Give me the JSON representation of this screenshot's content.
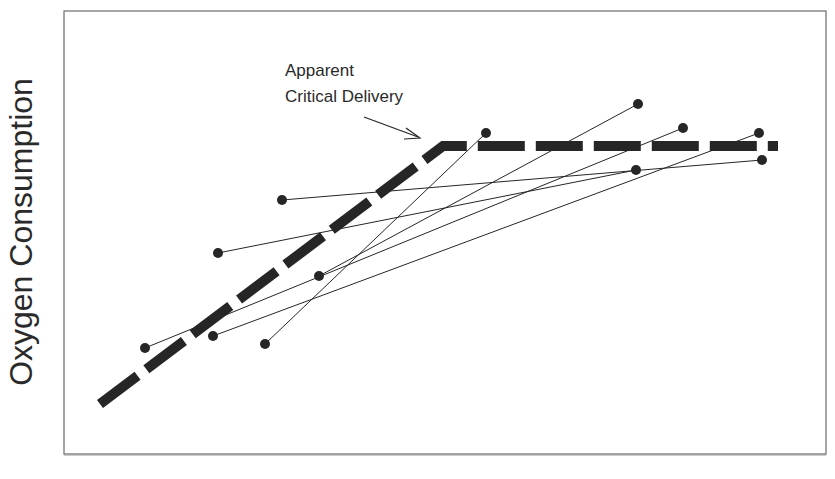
{
  "chart_data": {
    "type": "line",
    "title": "",
    "xlabel": "",
    "ylabel": "Oxygen Consumption",
    "grid": false,
    "legend": null,
    "annotation": {
      "lines": [
        "Apparent",
        "Critical Delivery"
      ],
      "arrow_target": "breakpoint of dashed curve"
    },
    "reference_curve": {
      "name": "biphasic delivery-consumption relationship",
      "style": "thick dashed",
      "points_px": [
        [
          100,
          404
        ],
        [
          443,
          146
        ],
        [
          778,
          146
        ]
      ]
    },
    "series": [
      {
        "name": "pair-1",
        "points_px": [
          [
            282,
            200
          ],
          [
            762,
            160
          ]
        ]
      },
      {
        "name": "pair-2",
        "points_px": [
          [
            218,
            253
          ],
          [
            636,
            170
          ]
        ]
      },
      {
        "name": "pair-3",
        "points_px": [
          [
            319,
            276
          ],
          [
            638,
            104
          ]
        ]
      },
      {
        "name": "pair-4",
        "points_px": [
          [
            145,
            348
          ],
          [
            683,
            128
          ]
        ]
      },
      {
        "name": "pair-5",
        "points_px": [
          [
            213,
            336
          ],
          [
            759,
            133
          ]
        ]
      },
      {
        "name": "pair-6",
        "points_px": [
          [
            265,
            344
          ],
          [
            486,
            133
          ]
        ]
      }
    ],
    "plot_box_px": {
      "left": 64,
      "top": 11,
      "right": 826,
      "bottom": 454
    }
  },
  "labels": {
    "ylabel": "Oxygen Consumption",
    "annot_line1": "Apparent",
    "annot_line2": "Critical Delivery"
  },
  "colors": {
    "ink": "#262626",
    "frame": "#555555",
    "background": "#ffffff"
  }
}
